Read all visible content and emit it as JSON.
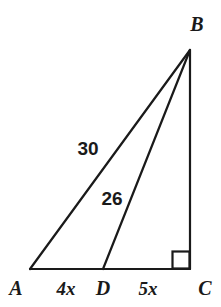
{
  "figure": {
    "type": "geometry-diagram",
    "stroke_color": "#1a1a1a",
    "background_color": "#ffffff",
    "stroke_width": 2,
    "vertices": [
      {
        "name": "A",
        "label": "A",
        "x": 30,
        "y": 269,
        "label_x": 16,
        "label_y": 288
      },
      {
        "name": "B",
        "label": "B",
        "x": 190,
        "y": 50,
        "label_x": 197,
        "label_y": 24
      },
      {
        "name": "C",
        "label": "C",
        "x": 190,
        "y": 269,
        "label_x": 205,
        "label_y": 288
      },
      {
        "name": "D",
        "label": "D",
        "x": 103,
        "y": 269,
        "label_x": 103,
        "label_y": 288
      }
    ],
    "segments": [
      {
        "name": "AB",
        "from": "A",
        "to": "B",
        "label": "30",
        "label_x": 88,
        "label_y": 148
      },
      {
        "name": "DB",
        "from": "D",
        "to": "B",
        "label": "26",
        "label_x": 112,
        "label_y": 198
      },
      {
        "name": "BC",
        "from": "B",
        "to": "C",
        "label": ""
      },
      {
        "name": "AD",
        "from": "A",
        "to": "D",
        "label": "4x",
        "label_x": 66,
        "label_y": 288
      },
      {
        "name": "DC",
        "from": "D",
        "to": "C",
        "label": "5x",
        "label_x": 148,
        "label_y": 288
      }
    ],
    "right_angle": {
      "at_vertex": "C",
      "marker": "square",
      "size": 18,
      "x": 172,
      "y": 251
    }
  }
}
